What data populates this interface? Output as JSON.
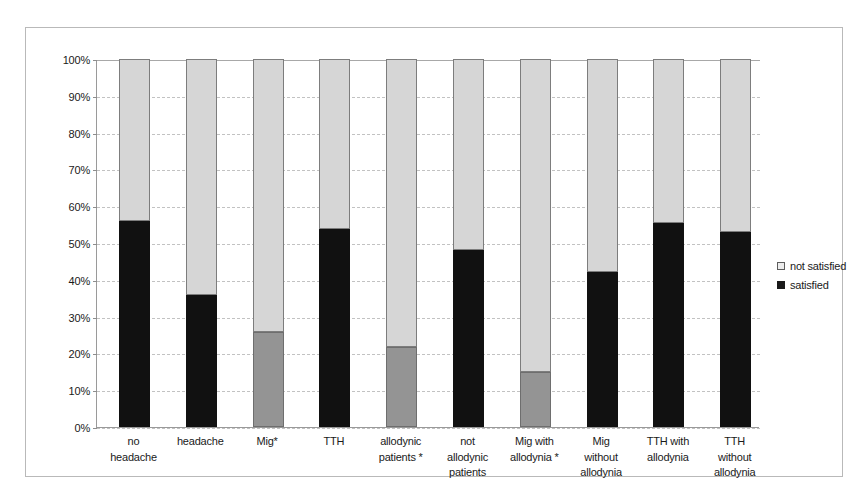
{
  "chart_data": {
    "type": "bar",
    "subtype": "stacked-percentage",
    "title": "",
    "xlabel": "",
    "ylabel": "",
    "ylim": [
      0,
      100
    ],
    "ytick_labels": [
      "0%",
      "10%",
      "20%",
      "30%",
      "40%",
      "50%",
      "60%",
      "70%",
      "80%",
      "90%",
      "100%"
    ],
    "ytick_values": [
      0,
      10,
      20,
      30,
      40,
      50,
      60,
      70,
      80,
      90,
      100
    ],
    "grid": true,
    "grid_axis": "y",
    "legend_position": "right",
    "categories": [
      "no headache",
      "headache",
      "Mig*",
      "TTH",
      "allodynic patients *",
      "not allodynic patients",
      "Mig with allodynia *",
      "Mig without allodynia",
      "TTH with allodynia",
      "TTH without allodynia"
    ],
    "category_lines": [
      [
        "no",
        "headache"
      ],
      [
        "headache"
      ],
      [
        "Mig*"
      ],
      [
        "TTH"
      ],
      [
        "allodynic",
        "patients *"
      ],
      [
        "not",
        "allodynic",
        "patients"
      ],
      [
        "Mig with",
        "allodynia *"
      ],
      [
        "Mig",
        "without",
        "allodynia"
      ],
      [
        "TTH with",
        "allodynia"
      ],
      [
        "TTH",
        "without",
        "allodynia"
      ]
    ],
    "series": [
      {
        "name": "satisfied",
        "color": "#111111",
        "values": [
          56,
          35.8,
          25.8,
          53.8,
          21.7,
          48,
          15,
          42,
          55.5,
          53
        ]
      },
      {
        "name": "not satisfied",
        "color": "#d6d6d6",
        "values": [
          44,
          64.2,
          74.2,
          46.2,
          78.3,
          52,
          85,
          58,
          44.5,
          47
        ]
      }
    ],
    "bar_fill_styles": [
      "black",
      "black",
      "gray",
      "black",
      "gray",
      "black",
      "gray",
      "black",
      "black",
      "black"
    ],
    "colors": {
      "satisfied_primary": "#111111",
      "satisfied_alt": "#949494",
      "not_satisfied": "#d6d6d6",
      "grid": "#c2c2c2",
      "axis": "#9a9a9a",
      "frame": "#b9b9b9",
      "text": "#1a1a1a"
    }
  },
  "legend": {
    "items": [
      {
        "label": "not satisfied",
        "swatch": "light"
      },
      {
        "label": "satisfied",
        "swatch": "dark"
      }
    ]
  }
}
